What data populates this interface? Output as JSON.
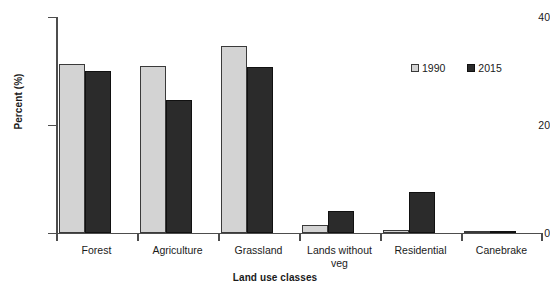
{
  "chart_data": {
    "type": "bar",
    "title": "",
    "xlabel": "Land use classes",
    "ylabel": "Percent (%)",
    "categories": [
      "Forest",
      "Agriculture",
      "Grassland",
      "Lands without\nveg",
      "Residential",
      "Canebrake"
    ],
    "series": [
      {
        "name": "1990",
        "color": "#d3d3d3",
        "values": [
          31.3,
          31.0,
          34.6,
          1.5,
          0.5,
          0.1
        ]
      },
      {
        "name": "2015",
        "color": "#2b2b2b",
        "values": [
          30.0,
          24.6,
          30.7,
          4.0,
          7.6,
          0.3
        ]
      }
    ],
    "ylim": [
      0,
      40
    ],
    "yticks": [
      0,
      20,
      40
    ],
    "ytick_labels": [
      "0",
      "20",
      "40"
    ],
    "grid": false,
    "legend_position": "top-right"
  },
  "axes": {
    "y_title": "Percent (%)",
    "x_title": "Land use classes",
    "y_tick_labels": [
      "0",
      "20",
      "40"
    ]
  },
  "legend": {
    "items": [
      {
        "label": "1990",
        "color": "#d3d3d3"
      },
      {
        "label": "2015",
        "color": "#2b2b2b"
      }
    ]
  }
}
